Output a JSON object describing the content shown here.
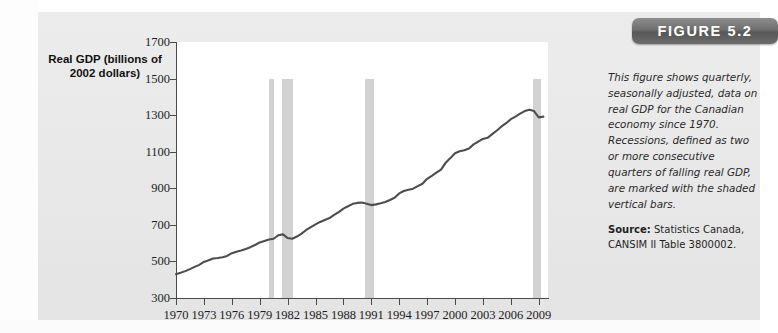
{
  "figure": {
    "badge_label": "FIGURE 5.2",
    "caption": "This figure shows quarterly, seasonally adjusted, data on real GDP for the Canadian economy since 1970. Recessions, defined as two or more consecutive quarters of falling real GDP, are marked with the shaded vertical bars.",
    "source_label": "Source:",
    "source_text": " Statistics Canada, CANSIM II Table 3800002."
  },
  "colors": {
    "card_background": "#e9e9e9",
    "plot_background": "#ffffff",
    "line": "#4d4d4d",
    "recession_bar": "#d2d2d2",
    "axis": "#4a4a4a",
    "badge_background": "#6e6e6e",
    "badge_text": "#ffffff"
  },
  "chart_data": {
    "type": "line",
    "title": "",
    "ylabel": "Real GDP (billions of 2002 dollars)",
    "xlabel": "",
    "ylim": [
      300,
      1700
    ],
    "xlim": [
      1970,
      2010
    ],
    "grid": false,
    "legend": "none",
    "ytick_labels": [
      "1700",
      "1500",
      "1300",
      "1100",
      "900",
      "700",
      "500",
      "300"
    ],
    "yticks": [
      1700,
      1500,
      1300,
      1100,
      900,
      700,
      500,
      300
    ],
    "xtick_labels": [
      "1970",
      "1973",
      "1976",
      "1979",
      "1982",
      "1985",
      "1988",
      "1991",
      "1994",
      "1997",
      "2000",
      "2003",
      "2006",
      "2009"
    ],
    "xticks": [
      1970,
      1973,
      1976,
      1979,
      1982,
      1985,
      1988,
      1991,
      1994,
      1997,
      2000,
      2003,
      2006,
      2009
    ],
    "series": [
      {
        "name": "Real GDP",
        "x": [
          1970,
          1970.5,
          1971,
          1971.5,
          1972,
          1972.5,
          1973,
          1973.5,
          1974,
          1974.5,
          1975,
          1975.5,
          1976,
          1976.5,
          1977,
          1977.5,
          1978,
          1978.5,
          1979,
          1979.5,
          1980,
          1980.5,
          1981,
          1981.5,
          1982,
          1982.5,
          1983,
          1983.5,
          1984,
          1984.5,
          1985,
          1985.5,
          1986,
          1986.5,
          1987,
          1987.5,
          1988,
          1988.5,
          1989,
          1989.5,
          1990,
          1990.5,
          1991,
          1991.5,
          1992,
          1992.5,
          1993,
          1993.5,
          1994,
          1994.5,
          1995,
          1995.5,
          1996,
          1996.5,
          1997,
          1997.5,
          1998,
          1998.5,
          1999,
          1999.5,
          2000,
          2000.5,
          2001,
          2001.5,
          2002,
          2002.5,
          2003,
          2003.5,
          2004,
          2004.5,
          2005,
          2005.5,
          2006,
          2006.5,
          2007,
          2007.5,
          2008,
          2008.5,
          2009,
          2009.5
        ],
        "y": [
          430,
          438,
          447,
          458,
          470,
          481,
          497,
          506,
          516,
          519,
          523,
          530,
          545,
          553,
          560,
          568,
          578,
          590,
          604,
          612,
          620,
          624,
          643,
          648,
          628,
          624,
          636,
          652,
          672,
          688,
          703,
          716,
          727,
          737,
          754,
          770,
          789,
          802,
          815,
          820,
          822,
          816,
          808,
          812,
          818,
          825,
          836,
          848,
          872,
          885,
          892,
          898,
          912,
          925,
          952,
          968,
          985,
          1002,
          1040,
          1065,
          1092,
          1102,
          1108,
          1118,
          1140,
          1155,
          1170,
          1176,
          1196,
          1216,
          1238,
          1256,
          1278,
          1292,
          1308,
          1322,
          1330,
          1322,
          1288,
          1292
        ]
      }
    ],
    "recession_bars": [
      {
        "label": "1980 recession",
        "start": 1980.0,
        "end": 1980.5
      },
      {
        "label": "1981-82 recession",
        "start": 1981.4,
        "end": 1982.6
      },
      {
        "label": "1990-91 recession",
        "start": 1990.3,
        "end": 1991.3
      },
      {
        "label": "2008-09 recession",
        "start": 2008.4,
        "end": 2009.2
      }
    ],
    "recession_bar_top_value": 1500,
    "annotation": "Recessions are marked with the shaded vertical bars."
  }
}
